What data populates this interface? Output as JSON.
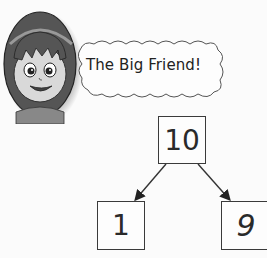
{
  "speech_bubble": {
    "text": "The Big Friend!"
  },
  "number_bond": {
    "whole": "10",
    "parts": [
      "1",
      "9"
    ],
    "part_labels_display": [
      "I",
      "q"
    ]
  },
  "colors": {
    "background": "#fbfbfb",
    "stroke": "#3a3a3a",
    "text": "#222222"
  }
}
